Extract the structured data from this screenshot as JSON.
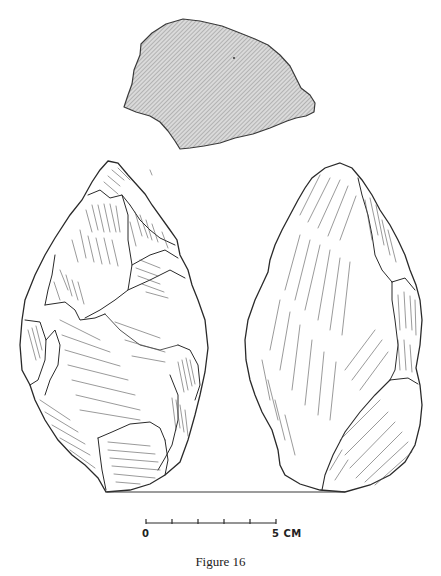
{
  "figure": {
    "caption": "Figure 16",
    "views": [
      {
        "name": "cross-section",
        "fill": "hatched-gray"
      },
      {
        "name": "face-a",
        "position": "left"
      },
      {
        "name": "face-b",
        "position": "right"
      }
    ]
  },
  "scale_bar": {
    "start_label": "0",
    "end_label": "5 CM",
    "ticks": 6,
    "unit": "cm"
  },
  "colors": {
    "ink": "#2a2a2a",
    "hatch": "#8a8a8a",
    "section_fill": "#d6d6d6",
    "background": "#ffffff"
  }
}
